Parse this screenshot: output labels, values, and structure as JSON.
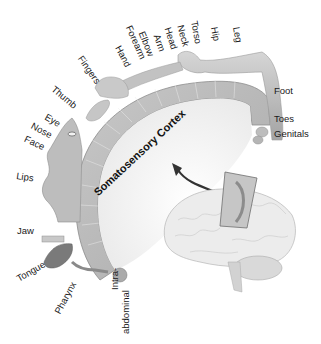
{
  "diagram": {
    "title": "Somatosensory Cortex",
    "labels": [
      {
        "id": "leg",
        "text": "Leg",
        "x": 241,
        "y": 26,
        "rot": 80
      },
      {
        "id": "hip",
        "text": "Hip",
        "x": 219,
        "y": 26,
        "rot": 80
      },
      {
        "id": "torso",
        "text": "Torso",
        "x": 199,
        "y": 20,
        "rot": 80
      },
      {
        "id": "neck",
        "text": "Neck",
        "x": 185,
        "y": 24,
        "rot": 75
      },
      {
        "id": "head",
        "text": "Head",
        "x": 172,
        "y": 26,
        "rot": 72
      },
      {
        "id": "arm",
        "text": "Arm",
        "x": 161,
        "y": 33,
        "rot": 70
      },
      {
        "id": "elbow",
        "text": "Elbow",
        "x": 146,
        "y": 30,
        "rot": 68
      },
      {
        "id": "forearm",
        "text": "Forearm",
        "x": 133,
        "y": 24,
        "rot": 66
      },
      {
        "id": "hand",
        "text": "Hand",
        "x": 122,
        "y": 44,
        "rot": 62
      },
      {
        "id": "fingers",
        "text": "Fingers",
        "x": 84,
        "y": 54,
        "rot": 55
      },
      {
        "id": "thumb",
        "text": "Thumb",
        "x": 56,
        "y": 84,
        "rot": 40
      },
      {
        "id": "eye",
        "text": "Eye",
        "x": 48,
        "y": 112,
        "rot": 30
      },
      {
        "id": "nose",
        "text": "Nose",
        "x": 34,
        "y": 121,
        "rot": 28
      },
      {
        "id": "face",
        "text": "Face",
        "x": 27,
        "y": 134,
        "rot": 25
      },
      {
        "id": "lips",
        "text": "Lips",
        "x": 17,
        "y": 171,
        "rot": 8
      },
      {
        "id": "jaw",
        "text": "Jaw",
        "x": 17,
        "y": 226,
        "rot": 0
      },
      {
        "id": "tongue",
        "text": "Tongue",
        "x": 15,
        "y": 275,
        "rot": -30
      },
      {
        "id": "pharynx",
        "text": "Pharynx",
        "x": 53,
        "y": 311,
        "rot": -62
      },
      {
        "id": "intra-abdominal-1",
        "text": "Intra-",
        "x": 122,
        "y": 290,
        "rot": -90
      },
      {
        "id": "intra-abdominal-2",
        "text": "abdominal",
        "x": 132,
        "y": 332,
        "rot": -90
      },
      {
        "id": "foot",
        "text": "Foot",
        "x": 274,
        "y": 86,
        "rot": 0
      },
      {
        "id": "toes",
        "text": "Toes",
        "x": 274,
        "y": 114,
        "rot": 0
      },
      {
        "id": "genitals",
        "text": "Genitals",
        "x": 274,
        "y": 129,
        "rot": 0
      }
    ],
    "cortex_label": {
      "text": "Somatosensory Cortex",
      "x": 92,
      "y": 187,
      "rot": -43
    }
  }
}
